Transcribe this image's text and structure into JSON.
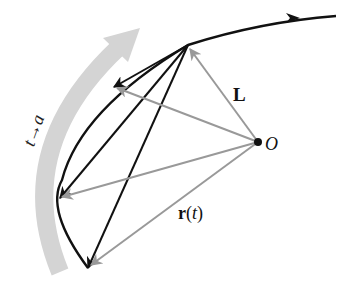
{
  "diagram": {
    "labels": {
      "L": "L",
      "O": "O",
      "r_bold": "r",
      "r_open": "(",
      "r_t": "t",
      "r_close": ")",
      "band_t": "t",
      "band_arrow": "→",
      "band_a": "a"
    },
    "colors": {
      "curve": "#111111",
      "gray_vector": "#999999",
      "band": "#d4d4d4"
    },
    "points": {
      "origin_O": [
        258,
        142
      ],
      "apex": [
        188,
        45
      ],
      "chord_ends": [
        [
          114,
          87
        ],
        [
          60,
          198
        ],
        [
          88,
          268
        ]
      ]
    }
  }
}
